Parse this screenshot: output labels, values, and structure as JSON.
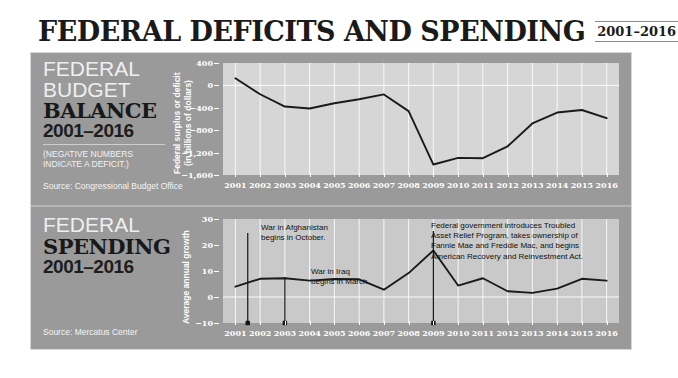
{
  "header": {
    "title": "FEDERAL DEFICITS AND SPENDING",
    "year_badge": "2001–2016"
  },
  "section_budget": {
    "label_line1": "FEDERAL",
    "label_line2": "BUDGET",
    "label_line3": "BALANCE",
    "label_years": "2001–2016",
    "label_note": "(NEGATIVE NUMBERS\nINDICATE A DEFICIT.)",
    "source": "Source: Congressional Budget Office",
    "axis_title": "Federal surplus or deficit\n(in billions of dollars)"
  },
  "section_spending": {
    "label_line1": "FEDERAL",
    "label_line2": "SPENDING",
    "label_years": "2001–2016",
    "source": "Source: Mercatus Center",
    "axis_title": "Average annual growth",
    "annotations": [
      {
        "id": "afghanistan",
        "text": "War in Afghanistan\nbegins in October.",
        "year": 2001.5
      },
      {
        "id": "iraq",
        "text": "War in Iraq\nbegins in March.",
        "year": 2003.0
      },
      {
        "id": "tarp",
        "text": "Federal government introduces Troubled\nAsset Relief Program, takes ownership of\nFannie Mae and Freddie Mac, and begins\nAmerican Recovery and Reinvestment Act.",
        "year": 2009.0
      }
    ]
  },
  "colors": {
    "panel_bg": "#9a9a9a",
    "plot_bg": "#d6d6d6",
    "line": "#1a1a1a",
    "text_light": "#ffffff",
    "text_dark": "#181818"
  },
  "chart_data": [
    {
      "id": "federal-budget-balance",
      "type": "line",
      "title": "FEDERAL BUDGET BALANCE 2001–2016",
      "xlabel": "",
      "ylabel": "Federal surplus or deficit (in billions of dollars)",
      "yticks": [
        400,
        0,
        -400,
        -800,
        -1200,
        -1600
      ],
      "ytick_labels": [
        "400",
        "0",
        "−400",
        "−800",
        "−1,200",
        "−1,600"
      ],
      "ylim": [
        -1600,
        400
      ],
      "grid": true,
      "categories": [
        2001,
        2002,
        2003,
        2004,
        2005,
        2006,
        2007,
        2008,
        2009,
        2010,
        2011,
        2012,
        2013,
        2014,
        2015,
        2016
      ],
      "x": [
        "2001",
        "2002",
        "2003",
        "2004",
        "2005",
        "2006",
        "2007",
        "2008",
        "2009",
        "2010",
        "2011",
        "2012",
        "2013",
        "2014",
        "2015",
        "2016"
      ],
      "values": [
        128,
        -158,
        -378,
        -413,
        -318,
        -248,
        -161,
        -459,
        -1413,
        -1294,
        -1300,
        -1087,
        -680,
        -485,
        -439,
        -585
      ],
      "legend": []
    },
    {
      "id": "federal-spending-growth",
      "type": "line",
      "title": "FEDERAL SPENDING 2001–2016",
      "xlabel": "",
      "ylabel": "Average annual growth",
      "yticks": [
        30,
        20,
        10,
        0,
        -10
      ],
      "ytick_labels": [
        "30",
        "20",
        "10",
        "0",
        "−10"
      ],
      "ylim": [
        -10,
        30
      ],
      "grid": true,
      "categories": [
        2001,
        2002,
        2003,
        2004,
        2005,
        2006,
        2007,
        2008,
        2009,
        2010,
        2011,
        2012,
        2013,
        2014,
        2015,
        2016
      ],
      "x": [
        "2001",
        "2002",
        "2003",
        "2004",
        "2005",
        "2006",
        "2007",
        "2008",
        "2009",
        "2010",
        "2011",
        "2012",
        "2013",
        "2014",
        "2015",
        "2016"
      ],
      "values": [
        4.0,
        7.0,
        7.2,
        6.3,
        6.9,
        6.8,
        2.8,
        9.2,
        17.9,
        4.4,
        7.2,
        2.2,
        1.6,
        3.2,
        7.0,
        6.3
      ],
      "legend": []
    }
  ]
}
